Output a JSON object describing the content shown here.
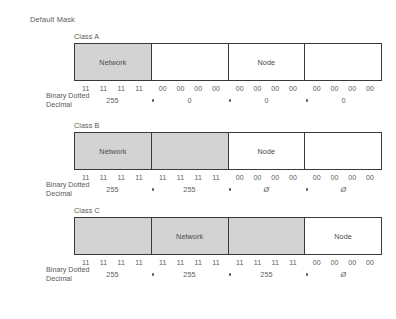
{
  "title": "Default Mask",
  "caption": {
    "line1": "Binary Dotted",
    "line2": "Decimal"
  },
  "colors": {
    "shaded": "#d3d3d3",
    "box_border": "#3a3a3a",
    "text": "#5a5a5a",
    "background": "#ffffff"
  },
  "classes": [
    {
      "label": "Class A",
      "octets": [
        {
          "shaded": true,
          "label": "Network",
          "bits": [
            "11",
            "11",
            "11",
            "11"
          ],
          "decimal": "255"
        },
        {
          "shaded": false,
          "label": "",
          "bits": [
            "00",
            "00",
            "00",
            "00"
          ],
          "decimal": "0"
        },
        {
          "shaded": false,
          "label": "Node",
          "bits": [
            "00",
            "00",
            "00",
            "00"
          ],
          "decimal": "0"
        },
        {
          "shaded": false,
          "label": "",
          "bits": [
            "00",
            "00",
            "00",
            "00"
          ],
          "decimal": "0"
        }
      ]
    },
    {
      "label": "Class B",
      "octets": [
        {
          "shaded": true,
          "label": "Network",
          "bits": [
            "11",
            "11",
            "11",
            "11"
          ],
          "decimal": "255"
        },
        {
          "shaded": true,
          "label": "",
          "bits": [
            "11",
            "11",
            "11",
            "11"
          ],
          "decimal": "255"
        },
        {
          "shaded": false,
          "label": "Node",
          "bits": [
            "00",
            "00",
            "00",
            "00"
          ],
          "decimal": "Ø"
        },
        {
          "shaded": false,
          "label": "",
          "bits": [
            "00",
            "00",
            "00",
            "00"
          ],
          "decimal": "Ø"
        }
      ]
    },
    {
      "label": "Class C",
      "octets": [
        {
          "shaded": true,
          "label": "",
          "bits": [
            "11",
            "11",
            "11",
            "11"
          ],
          "decimal": "255"
        },
        {
          "shaded": true,
          "label": "Network",
          "bits": [
            "11",
            "11",
            "11",
            "11"
          ],
          "decimal": "255"
        },
        {
          "shaded": true,
          "label": "",
          "bits": [
            "11",
            "11",
            "11",
            "11"
          ],
          "decimal": "255"
        },
        {
          "shaded": false,
          "label": "Node",
          "bits": [
            "00",
            "00",
            "00",
            "00"
          ],
          "decimal": "Ø"
        }
      ]
    }
  ]
}
